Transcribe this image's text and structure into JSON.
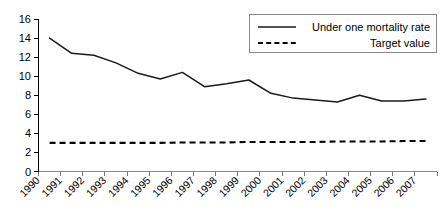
{
  "chart_data": {
    "type": "line",
    "title": "",
    "subtitle": "",
    "xlabel": "",
    "ylabel": "",
    "x": [
      "1990",
      "1991",
      "1992",
      "1993",
      "1994",
      "1995",
      "1996",
      "1997",
      "1998",
      "1999",
      "2000",
      "2001",
      "2002",
      "2003",
      "2004",
      "2005",
      "2006",
      "2007"
    ],
    "categories": [
      "1990",
      "1991",
      "1992",
      "1993",
      "1994",
      "1995",
      "1996",
      "1997",
      "1998",
      "1999",
      "2000",
      "2001",
      "2002",
      "2003",
      "2004",
      "2005",
      "2006",
      "2007"
    ],
    "series": [
      {
        "name": "Under one mortality rate",
        "style": "solid",
        "color": "#1a1a1a",
        "values": [
          14.0,
          12.4,
          12.2,
          11.4,
          10.3,
          9.7,
          10.4,
          8.9,
          9.2,
          9.6,
          8.2,
          7.7,
          7.5,
          7.3,
          8.0,
          7.4,
          7.4,
          7.6
        ]
      },
      {
        "name": "Target value",
        "style": "dashed",
        "color": "#000000",
        "values": [
          3.0,
          3.0,
          3.0,
          3.0,
          3.0,
          3.0,
          3.05,
          3.05,
          3.05,
          3.1,
          3.1,
          3.1,
          3.1,
          3.15,
          3.15,
          3.15,
          3.2,
          3.2
        ]
      }
    ],
    "ylim": [
      0,
      16
    ],
    "ytick_step": 2,
    "yticks": [
      "0",
      "2",
      "4",
      "6",
      "8",
      "10",
      "12",
      "14",
      "16"
    ],
    "xtick_rotation": -45,
    "grid": false,
    "legend": {
      "position": "top-right",
      "border": true,
      "entries": [
        {
          "label": "Under one mortality rate",
          "style": "solid"
        },
        {
          "label": "Target value",
          "style": "dashed"
        }
      ]
    }
  }
}
